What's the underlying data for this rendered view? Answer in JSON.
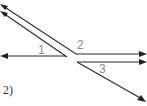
{
  "diagram": {
    "problem_label": "2)",
    "angle_labels": [
      {
        "id": "angle-1",
        "text": "1"
      },
      {
        "id": "angle-2",
        "text": "2"
      },
      {
        "id": "angle-3",
        "text": "3"
      }
    ],
    "colors": {
      "line": "#2a2a2a",
      "label": "#8a8a8a"
    }
  }
}
